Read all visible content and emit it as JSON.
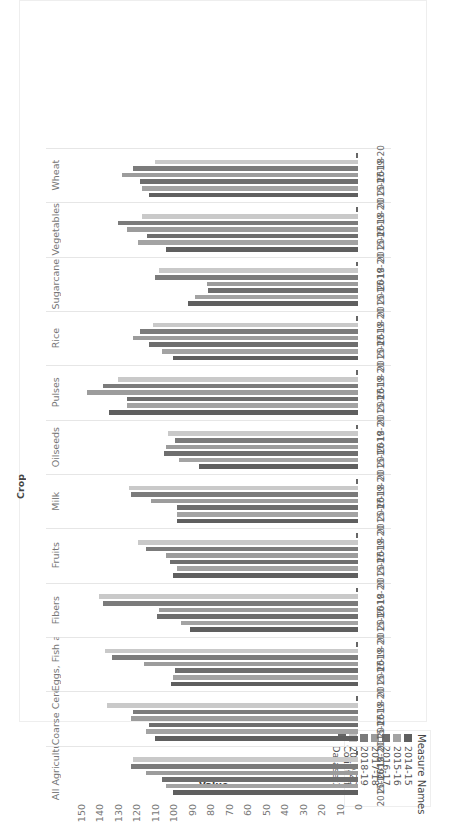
{
  "chart_data": {
    "type": "bar",
    "orientation": "vertical-bars, image rotated 90 degrees",
    "title": "",
    "column_header": "Crop",
    "ylabel": "Value",
    "ylim": [
      0,
      150
    ],
    "yticks": [
      0,
      10,
      20,
      30,
      40,
      50,
      60,
      70,
      80,
      90,
      100,
      110,
      120,
      130,
      140,
      150
    ],
    "grid": false,
    "legend_title": "Measure Names",
    "legend_position": "top-right",
    "categories": [
      "All Agriculture",
      "Coarse Cereals",
      "Eggs, Fish an..",
      "Fibers",
      "Fruits",
      "Milk",
      "Oilseeds",
      "Pulses",
      "Rice",
      "Sugarcane",
      "Vegetables",
      "Wheat"
    ],
    "sub_tick_labels": [
      "2015-16",
      "2017-18",
      "2019-20"
    ],
    "series": [
      {
        "name": "2014-15",
        "color": "#5f5f5f",
        "values": [
          100,
          110,
          101,
          91,
          100,
          98,
          86,
          135,
          100,
          92,
          104,
          113
        ]
      },
      {
        "name": "2015-16",
        "color": "#a3a3a3",
        "values": [
          104,
          115,
          100,
          96,
          98,
          98,
          97,
          125,
          106,
          88,
          119,
          117
        ]
      },
      {
        "name": "2016-17",
        "color": "#6e6e6e",
        "values": [
          106,
          113,
          99,
          109,
          102,
          98,
          105,
          125,
          113,
          81,
          114,
          118
        ]
      },
      {
        "name": "2017-18",
        "color": "#9c9c9c",
        "values": [
          115,
          123,
          116,
          108,
          104,
          112,
          104,
          147,
          122,
          82,
          125,
          128
        ]
      },
      {
        "name": "2018-19",
        "color": "#7b7b7b",
        "values": [
          123,
          122,
          133,
          138,
          115,
          123,
          99,
          138,
          118,
          110,
          130,
          122
        ]
      },
      {
        "name": "2019-20",
        "color": "#c9c9c9",
        "values": [
          122,
          136,
          137,
          140,
          119,
          124,
          103,
          130,
          111,
          108,
          117,
          110
        ]
      },
      {
        "name": "Count of Dataset2",
        "color": "#666666",
        "values": [
          1,
          1,
          1,
          1,
          1,
          1,
          1,
          1,
          1,
          1,
          1,
          1
        ]
      }
    ]
  },
  "ui": {
    "legend": {
      "title": "Measure Names",
      "items": [
        "2014-15",
        "2015-16",
        "2016-17",
        "2017-18",
        "2018-19",
        "2019-20",
        "Count of Dataset2"
      ]
    },
    "column_header": "Crop",
    "axis_title": "Value"
  }
}
